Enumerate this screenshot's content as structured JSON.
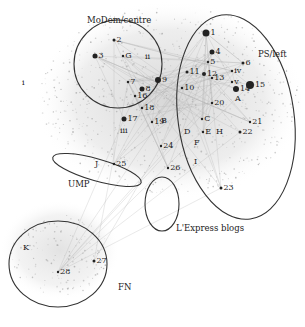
{
  "groups": [
    {
      "id": "modem",
      "label": "MoDem/centre",
      "x": 87,
      "y": 16,
      "ellipse": {
        "cx": 118,
        "cy": 64,
        "rx": 44,
        "ry": 44,
        "rot": 0
      }
    },
    {
      "id": "ps",
      "label": "PS/left",
      "x": 258,
      "y": 50,
      "ellipse": {
        "cx": 236,
        "cy": 117,
        "rx": 58,
        "ry": 103,
        "rot": -8
      }
    },
    {
      "id": "ump",
      "label": "UMP",
      "x": 68,
      "y": 180,
      "ellipse": {
        "cx": 97,
        "cy": 170,
        "rx": 46,
        "ry": 11,
        "rot": 16
      }
    },
    {
      "id": "lexpress",
      "label": "L'Express blogs",
      "x": 176,
      "y": 224,
      "ellipse": {
        "cx": 162,
        "cy": 204,
        "rx": 17,
        "ry": 27,
        "rot": 0
      }
    },
    {
      "id": "fn",
      "label": "FN",
      "x": 118,
      "y": 283,
      "ellipse": {
        "cx": 58,
        "cy": 264,
        "rx": 49,
        "ry": 43,
        "rot": 0
      }
    }
  ],
  "nodes": [
    {
      "label": "1",
      "x": 206,
      "y": 33,
      "r": 3.5
    },
    {
      "label": "2",
      "x": 114,
      "y": 40,
      "r": 1.5
    },
    {
      "label": "3",
      "x": 95,
      "y": 56,
      "r": 2.5
    },
    {
      "label": "4",
      "x": 212,
      "y": 52,
      "r": 2.5
    },
    {
      "label": "5",
      "x": 208,
      "y": 62,
      "r": 1.2
    },
    {
      "label": "6",
      "x": 243,
      "y": 63,
      "r": 1.5
    },
    {
      "label": "7",
      "x": 128,
      "y": 82,
      "r": 1.2
    },
    {
      "label": "8",
      "x": 142,
      "y": 89,
      "r": 2.5
    },
    {
      "label": "9",
      "x": 158,
      "y": 80,
      "r": 3
    },
    {
      "label": "10",
      "x": 182,
      "y": 88,
      "r": 1.2
    },
    {
      "label": "11",
      "x": 187,
      "y": 72,
      "r": 1.5
    },
    {
      "label": "12",
      "x": 204,
      "y": 74,
      "r": 2
    },
    {
      "label": "13",
      "x": 212,
      "y": 78,
      "r": 1.2
    },
    {
      "label": "14",
      "x": 236,
      "y": 89,
      "r": 3
    },
    {
      "label": "15",
      "x": 250,
      "y": 85,
      "r": 4
    },
    {
      "label": "16",
      "x": 135,
      "y": 96,
      "r": 1.2
    },
    {
      "label": "17",
      "x": 124,
      "y": 119,
      "r": 2.5
    },
    {
      "label": "18",
      "x": 142,
      "y": 108,
      "r": 1.2
    },
    {
      "label": "19",
      "x": 152,
      "y": 122,
      "r": 1.2
    },
    {
      "label": "20",
      "x": 212,
      "y": 103,
      "r": 1.2
    },
    {
      "label": "21",
      "x": 250,
      "y": 122,
      "r": 1.2
    },
    {
      "label": "22",
      "x": 240,
      "y": 132,
      "r": 1.5
    },
    {
      "label": "23",
      "x": 221,
      "y": 188,
      "r": 1.5
    },
    {
      "label": "24",
      "x": 161,
      "y": 146,
      "r": 1.2
    },
    {
      "label": "25",
      "x": 114,
      "y": 164,
      "r": 1.2
    },
    {
      "label": "26",
      "x": 168,
      "y": 168,
      "r": 1.2
    },
    {
      "label": "27",
      "x": 94,
      "y": 261,
      "r": 1.5
    },
    {
      "label": "28",
      "x": 58,
      "y": 272,
      "r": 1.2
    },
    {
      "label": "i",
      "x": 24,
      "y": 83,
      "r": 0
    },
    {
      "label": "ii",
      "x": 147,
      "y": 57,
      "r": 0
    },
    {
      "label": "iii",
      "x": 122,
      "y": 131,
      "r": 0
    },
    {
      "label": "iv",
      "x": 232,
      "y": 71,
      "r": 1.2
    },
    {
      "label": "v",
      "x": 232,
      "y": 82,
      "r": 1.2
    },
    {
      "label": "A",
      "x": 237,
      "y": 99,
      "r": 0
    },
    {
      "label": "B",
      "x": 163,
      "y": 121,
      "r": 0
    },
    {
      "label": "C",
      "x": 202,
      "y": 119,
      "r": 1.2
    },
    {
      "label": "D",
      "x": 186,
      "y": 132,
      "r": 0
    },
    {
      "label": "E",
      "x": 203,
      "y": 132,
      "r": 1.2
    },
    {
      "label": "F",
      "x": 196,
      "y": 143,
      "r": 0
    },
    {
      "label": "G",
      "x": 123,
      "y": 56,
      "r": 1.2
    },
    {
      "label": "H",
      "x": 218,
      "y": 132,
      "r": 0
    },
    {
      "label": "I",
      "x": 196,
      "y": 162,
      "r": 0
    },
    {
      "label": "J",
      "x": 97,
      "y": 164,
      "r": 0
    },
    {
      "label": "K",
      "x": 25,
      "y": 248,
      "r": 0
    }
  ],
  "caption": "Fig. — blog network clusters by political affiliation",
  "colors": {
    "ellipse": "#333333",
    "node": "#222222",
    "edge": "#bdbdbd",
    "cloud": "#d8d8d8"
  }
}
